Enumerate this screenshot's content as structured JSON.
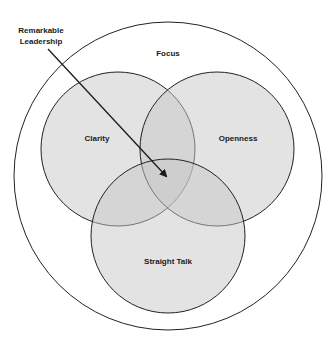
{
  "diagram": {
    "type": "venn",
    "pointer_label_line1": "Remarkable",
    "pointer_label_line2": "Leadership",
    "outer_label": "Focus",
    "sets": [
      {
        "name": "Clarity"
      },
      {
        "name": "Openness"
      },
      {
        "name": "Straight Talk"
      }
    ],
    "colors": {
      "stroke": "#222222",
      "fill": "#c8c8c8",
      "background": "#ffffff"
    }
  }
}
